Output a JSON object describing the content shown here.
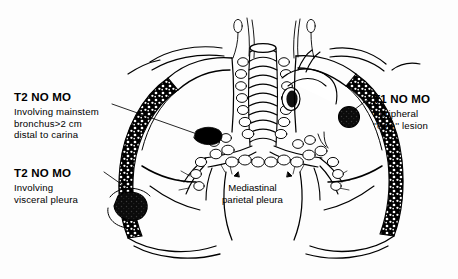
{
  "figure": {
    "name": "lung-cancer-staging-diagram",
    "ink_color": "#000000",
    "background_color": "#ffffff"
  },
  "callouts": [
    {
      "id": "mainstem",
      "title": "T2 NO MO",
      "body": "Involving mainstem\nbronchus>2 cm\ndistal to carina",
      "leader": "long horizontal line to left mainstem bronchus tumor"
    },
    {
      "id": "visceral",
      "title": "T2 NO MO",
      "body": "Involving\nvisceral pleura",
      "leader": "short dash to lower left pleural tumor"
    },
    {
      "id": "coin",
      "title": "T1 NO MO",
      "body": "Peripheral\n''coin'' lesion",
      "leader": "short diagonal to round peripheral nodule"
    }
  ],
  "anatomy_label": {
    "text": "Mediastinal\nparietal pleura"
  },
  "tumors": [
    {
      "name": "mainstem-bronchus-tumor",
      "shape": "irregular dark mass",
      "cx": 208,
      "cy": 135
    },
    {
      "name": "visceral-pleura-tumor",
      "shape": "irregular dark mass",
      "cx": 129,
      "cy": 207
    },
    {
      "name": "peripheral-coin-lesion",
      "shape": "round dark nodule",
      "cx": 349,
      "cy": 117
    }
  ]
}
